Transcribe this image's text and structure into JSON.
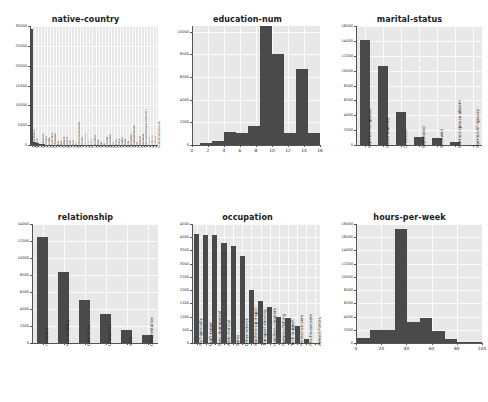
{
  "figure": {
    "width": 488,
    "height": 402,
    "background": "#ffffff",
    "plot_background": "#e8e8e8",
    "bar_color": "#4a4a4a",
    "grid_color": "#fbfbfb",
    "rows": 2,
    "cols": 3
  },
  "chart_data": [
    {
      "type": "bar",
      "title": "native-country",
      "xlabel": "",
      "ylabel": "",
      "ylim": [
        0,
        30000
      ],
      "yticks": [
        0,
        5000,
        10000,
        15000,
        20000,
        25000,
        30000
      ],
      "ytick_labels": [
        "0",
        "5000",
        "10000",
        "15000",
        "20000",
        "25000",
        "30000"
      ],
      "grid": true,
      "legend": "none",
      "categories": [
        "United-States",
        "Mexico",
        "?",
        "Philippines",
        "Germany",
        "Canada",
        "Puerto-Rico",
        "El-Salvador",
        "India",
        "Cuba",
        "England",
        "Jamaica",
        "South",
        "China",
        "Italy",
        "Dominican-Republic",
        "Vietnam",
        "Guatemala",
        "Japan",
        "Poland",
        "Columbia",
        "Taiwan",
        "Haiti",
        "Iran",
        "Portugal",
        "Nicaragua",
        "Peru",
        "France",
        "Greece",
        "Ecuador",
        "Ireland",
        "Hong",
        "Cambodia",
        "Trinadad&Tobago",
        "Laos",
        "Thailand",
        "Yugoslavia",
        "Outlying-US(Guam-USVI-etc)",
        "Hungary",
        "Honduras",
        "Scotland",
        "Holand-Netherlands"
      ],
      "values": [
        29170,
        643,
        583,
        198,
        137,
        121,
        114,
        106,
        100,
        95,
        90,
        81,
        80,
        75,
        73,
        70,
        67,
        64,
        62,
        60,
        59,
        51,
        44,
        43,
        37,
        34,
        31,
        29,
        29,
        28,
        24,
        20,
        19,
        19,
        18,
        18,
        16,
        14,
        13,
        13,
        12,
        1
      ]
    },
    {
      "type": "bar",
      "title": "education-num",
      "xlabel": "",
      "ylabel": "",
      "xlim": [
        0,
        16
      ],
      "ylim": [
        0,
        10500
      ],
      "yticks": [
        0,
        2000,
        4000,
        6000,
        8000,
        10000
      ],
      "ytick_labels": [
        "0",
        "2000",
        "4000",
        "6000",
        "8000",
        "10000"
      ],
      "xticks": [
        0,
        2,
        4,
        6,
        8,
        10,
        12,
        14,
        16
      ],
      "xtick_labels": [
        "0",
        "2",
        "4",
        "6",
        "8",
        "10",
        "12",
        "14",
        "16"
      ],
      "grid": true,
      "legend": "none",
      "bins": [
        {
          "x0": 1,
          "x1": 2.5,
          "value": 200
        },
        {
          "x0": 2.5,
          "x1": 4,
          "value": 330
        },
        {
          "x0": 4,
          "x1": 5.5,
          "value": 1120
        },
        {
          "x0": 5.5,
          "x1": 7,
          "value": 1060
        },
        {
          "x0": 7,
          "x1": 8.5,
          "value": 1650
        },
        {
          "x0": 8.5,
          "x1": 10,
          "value": 10500
        },
        {
          "x0": 10,
          "x1": 11.5,
          "value": 8025
        },
        {
          "x0": 11.5,
          "x1": 13,
          "value": 1100
        },
        {
          "x0": 13,
          "x1": 14.5,
          "value": 6750
        },
        {
          "x0": 14.5,
          "x1": 16,
          "value": 1050
        }
      ]
    },
    {
      "type": "bar",
      "title": "marital-status",
      "xlabel": "",
      "ylabel": "",
      "ylim": [
        0,
        16000
      ],
      "yticks": [
        0,
        2000,
        4000,
        6000,
        8000,
        10000,
        12000,
        14000,
        16000
      ],
      "ytick_labels": [
        "0",
        "2000",
        "4000",
        "6000",
        "8000",
        "10000",
        "12000",
        "14000",
        "16000"
      ],
      "grid": true,
      "legend": "none",
      "categories": [
        "Married-civ-spouse",
        "Never-married",
        "Divorced",
        "Separated",
        "Widowed",
        "Married-spouse-absent",
        "Married-AF-spouse"
      ],
      "values": [
        14065,
        10683,
        4443,
        1025,
        993,
        418,
        23
      ]
    },
    {
      "type": "bar",
      "title": "relationship",
      "xlabel": "",
      "ylabel": "",
      "ylim": [
        0,
        14000
      ],
      "yticks": [
        0,
        2000,
        4000,
        6000,
        8000,
        10000,
        12000,
        14000
      ],
      "ytick_labels": [
        "0",
        "2000",
        "4000",
        "6000",
        "8000",
        "10000",
        "12000",
        "14000"
      ],
      "grid": true,
      "legend": "none",
      "categories": [
        "Husband",
        "Not-in-family",
        "Own-child",
        "Unmarried",
        "Wife",
        "Other-relative"
      ],
      "values": [
        12463,
        8305,
        5068,
        3446,
        1568,
        981
      ]
    },
    {
      "type": "bar",
      "title": "occupation",
      "xlabel": "",
      "ylabel": "",
      "ylim": [
        0,
        4500
      ],
      "yticks": [
        0,
        500,
        1000,
        1500,
        2000,
        2500,
        3000,
        3500,
        4000,
        4500
      ],
      "ytick_labels": [
        "0",
        "500",
        "1000",
        "1500",
        "2000",
        "2500",
        "3000",
        "3500",
        "4000",
        "4500"
      ],
      "grid": true,
      "legend": "none",
      "categories": [
        "Prof-specialty",
        "Craft-repair",
        "Exec-managerial",
        "Adm-clerical",
        "Sales",
        "Other-service",
        "Machine-op-inspct",
        "Transport-moving",
        "Handlers-cleaners",
        "Farming-fishing",
        "Tech-support",
        "Protective-serv",
        "Priv-house-serv",
        "Armed-Forces"
      ],
      "values": [
        4140,
        4099,
        4066,
        3770,
        3650,
        3295,
        2002,
        1597,
        1370,
        994,
        928,
        649,
        149,
        9
      ]
    },
    {
      "type": "bar",
      "title": "hours-per-week",
      "xlabel": "",
      "ylabel": "",
      "xlim": [
        0,
        100
      ],
      "ylim": [
        0,
        18000
      ],
      "yticks": [
        0,
        2000,
        4000,
        6000,
        8000,
        10000,
        12000,
        14000,
        16000,
        18000
      ],
      "ytick_labels": [
        "0",
        "2000",
        "4000",
        "6000",
        "8000",
        "10000",
        "12000",
        "14000",
        "16000",
        "18000"
      ],
      "xticks": [
        0,
        20,
        40,
        60,
        80,
        100
      ],
      "xtick_labels": [
        "0",
        "20",
        "40",
        "60",
        "80",
        "100"
      ],
      "grid": true,
      "legend": "none",
      "bins": [
        {
          "x0": 1,
          "x1": 10.9,
          "value": 800
        },
        {
          "x0": 10.9,
          "x1": 20.8,
          "value": 1900
        },
        {
          "x0": 20.8,
          "x1": 30.7,
          "value": 1930
        },
        {
          "x0": 30.7,
          "x1": 40.6,
          "value": 17300
        },
        {
          "x0": 40.6,
          "x1": 50.5,
          "value": 3200
        },
        {
          "x0": 50.5,
          "x1": 60.4,
          "value": 3780
        },
        {
          "x0": 60.4,
          "x1": 70.3,
          "value": 1850
        },
        {
          "x0": 70.3,
          "x1": 80.2,
          "value": 560
        },
        {
          "x0": 80.2,
          "x1": 90.1,
          "value": 120
        },
        {
          "x0": 90.1,
          "x1": 100,
          "value": 90
        }
      ]
    }
  ]
}
